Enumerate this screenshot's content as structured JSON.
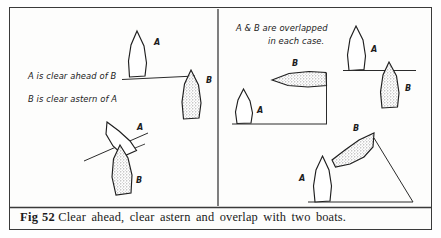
{
  "figure": {
    "caption_number": "Fig 52",
    "caption_text": "Clear ahead, clear astern and overlap with two boats.",
    "panels": {
      "left": {
        "note_line_1": "A is clear ahead of B",
        "note_line_2": "B is clear astern of A",
        "cases": [
          {
            "name": "upright-pair",
            "boat_a_label": "A",
            "boat_b_label": "B",
            "boat_a_fill": "white",
            "boat_b_fill": "stippled"
          },
          {
            "name": "tilted-pair",
            "boat_a_label": "A",
            "boat_b_label": "B",
            "boat_a_fill": "white",
            "boat_b_fill": "stippled"
          }
        ]
      },
      "right": {
        "note_line_1": "A & B are overlapped",
        "note_line_2": "in each case.",
        "cases": [
          {
            "name": "beam-on-pair",
            "boat_a_label": "A",
            "boat_b_label": "B",
            "boat_a_fill": "white",
            "boat_b_fill": "stippled"
          },
          {
            "name": "staggered-pair",
            "boat_a_label": "A",
            "boat_b_label": "B",
            "boat_a_fill": "white",
            "boat_b_fill": "stippled"
          },
          {
            "name": "diagonal-pair",
            "boat_a_label": "A",
            "boat_b_label": "B",
            "boat_a_fill": "white",
            "boat_b_fill": "stippled"
          }
        ]
      }
    },
    "colors": {
      "ink": "#1f1f1f",
      "border": "#3a3a3a",
      "stipple": "#9a9a9a",
      "paper": "#fdfdfc"
    }
  }
}
